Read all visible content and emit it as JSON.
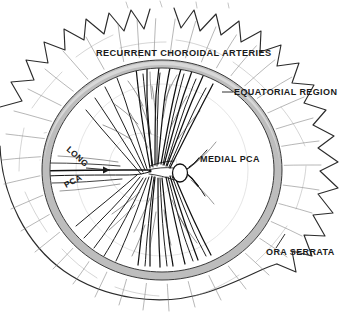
{
  "figure": {
    "background_color": "#ffffff",
    "ring_color": "#bdbdbd",
    "ink_color": "#111111",
    "width": 341,
    "height": 317
  },
  "labels": {
    "recurrent_choroidal_arteries": "RECURRENT CHOROIDAL  ARTERIES",
    "equatorial_region": "EQUATORIAL REGION",
    "medial_pca": "MEDIAL  PCA",
    "long_pca_upper": "LONG",
    "long_pca_lower": "PCA",
    "ora_serrata": "ORA SERRATA"
  },
  "structures": [
    {
      "name": "equatorial-region-ring",
      "kind": "band",
      "note": "grey annular band marking the equator of the globe"
    },
    {
      "name": "ora-serrata-boundary",
      "kind": "scalloped-arc",
      "note": "toothed outer boundary of the retina"
    },
    {
      "name": "recurrent-choroidal-arteries",
      "kind": "vessel-fan",
      "note": "vessels running outward past the equator"
    },
    {
      "name": "medial-posterior-ciliary-artery",
      "kind": "vessel-trunk",
      "note": "enters near the optic disc from the medial side"
    },
    {
      "name": "long-posterior-ciliary-artery",
      "kind": "vessel-trunk",
      "note": "runs horizontally along the lateral meridian"
    },
    {
      "name": "optic-disc",
      "kind": "oval",
      "note": "small oval at the vascular convergence point"
    }
  ]
}
